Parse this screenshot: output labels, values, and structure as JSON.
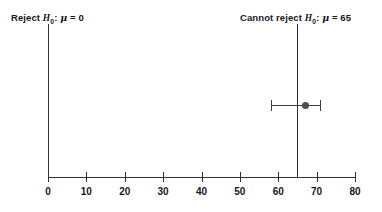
{
  "figure": {
    "width": 382,
    "height": 212,
    "background": "#ffffff",
    "ink_color": "#2c2f35"
  },
  "annotations": {
    "left": {
      "name": "reject-null-label",
      "prefix": "Reject ",
      "h_symbol": "H",
      "h_subscript": "0",
      "separator": ": ",
      "mu_symbol": "μ",
      "equals": " = ",
      "value": "0",
      "full_text": "Reject H0: μ = 0"
    },
    "right": {
      "name": "cannot-reject-null-label",
      "prefix": "Cannot reject ",
      "h_symbol": "H",
      "h_subscript": "0",
      "separator": ": ",
      "mu_symbol": "μ",
      "equals": " = ",
      "value": "65",
      "full_text": "Cannot reject H0: μ = 65"
    }
  },
  "chart_data": {
    "type": "scatter",
    "title": "",
    "subtitle": "",
    "xlabel": "",
    "ylabel": "",
    "xlim": [
      0,
      80
    ],
    "ylim": [
      0,
      1
    ],
    "grid": false,
    "legend": null,
    "x_ticks": [
      0,
      10,
      20,
      30,
      40,
      50,
      60,
      70,
      80
    ],
    "x_tick_labels": [
      "0",
      "10",
      "20",
      "30",
      "40",
      "50",
      "60",
      "70",
      "80"
    ],
    "series": [
      {
        "name": "confidence-interval",
        "type": "errorbar",
        "point_estimate": 67,
        "ci_lower": 58,
        "ci_upper": 71,
        "marker": "filled-circle",
        "marker_color": "#4a4d55",
        "line_color": "#3a3d44"
      }
    ],
    "reference_lines": [
      {
        "name": "null-hypothesis-line",
        "x": 0,
        "label": "Reject H0: μ = 0",
        "color": "#2c2f35"
      },
      {
        "name": "alternative-hypothesis-line",
        "x": 65,
        "label": "Cannot reject H0: μ = 65",
        "color": "#2c2f35"
      }
    ]
  }
}
